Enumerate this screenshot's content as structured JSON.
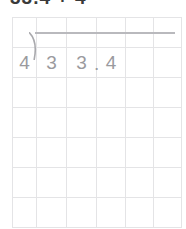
{
  "heading": {
    "text": "33.4 ÷ 4",
    "color": "#3a3a3a",
    "note": "clipped at top edge of screenshot"
  },
  "worksheet": {
    "type": "long-division-grid",
    "grid": {
      "columns": 6,
      "rows": 7,
      "line_color": "#e4e4e6"
    },
    "ink_color": "#9a9a9e",
    "division_bar_color": "#b9b9bd",
    "problem": {
      "divisor": "4",
      "dividend": "33.4",
      "bracket_glyph": ")",
      "quotient": ""
    },
    "cells": [
      [
        "",
        "",
        "",
        "",
        "",
        ""
      ],
      [
        "4",
        "3",
        "3",
        "4",
        "",
        ""
      ],
      [
        "",
        "",
        "",
        "",
        "",
        ""
      ],
      [
        "",
        "",
        "",
        "",
        "",
        ""
      ],
      [
        "",
        "",
        "",
        "",
        "",
        ""
      ],
      [
        "",
        "",
        "",
        "",
        "",
        ""
      ],
      [
        "",
        "",
        "",
        "",
        "",
        ""
      ]
    ],
    "decimal_point": ".",
    "decimal_point_after_column": 2
  }
}
